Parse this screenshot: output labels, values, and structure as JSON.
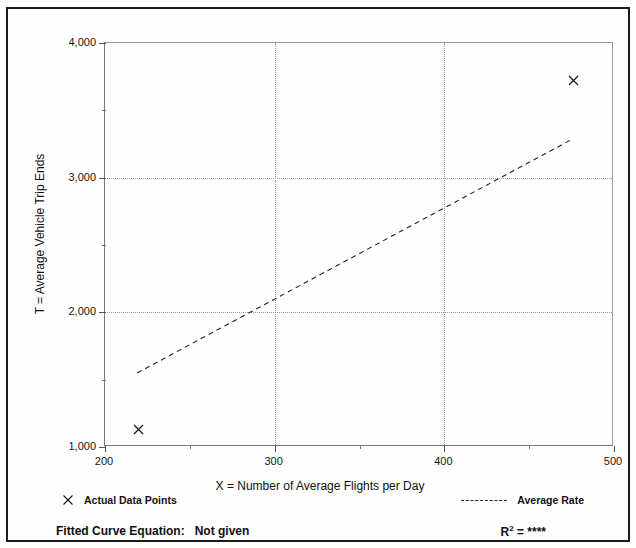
{
  "document": {
    "top_crop_left": "",
    "top_crop_right": ""
  },
  "chart_data": {
    "type": "scatter",
    "title": "",
    "xlabel": "X = Number of Average Flights per Day",
    "ylabel": "T = Average Vehicle Trip Ends",
    "xlim": [
      200,
      500
    ],
    "ylim": [
      1000,
      4000
    ],
    "x_ticks": [
      200,
      300,
      400,
      500
    ],
    "x_tick_labels": [
      "200",
      "300",
      "400",
      "500"
    ],
    "x_minor_ticks": [
      250,
      350,
      450
    ],
    "y_ticks": [
      1000,
      2000,
      3000,
      4000
    ],
    "y_tick_labels": [
      "1,000",
      "2,000",
      "3,000",
      "4,000"
    ],
    "y_minor_ticks": [
      1500,
      2500,
      3500
    ],
    "grid": "dotted-major",
    "legend_position": "below-plot",
    "series": [
      {
        "name": "Actual Data Points",
        "type": "scatter",
        "marker": "x",
        "points": [
          {
            "x": 220,
            "y": 1130
          },
          {
            "x": 476,
            "y": 3720
          }
        ]
      },
      {
        "name": "Average Rate",
        "type": "line",
        "style": "dashed",
        "points": [
          {
            "x": 219,
            "y": 1550
          },
          {
            "x": 476,
            "y": 3290
          }
        ]
      }
    ]
  },
  "legend": {
    "actual_points_label": "Actual Data Points",
    "average_rate_label": "Average Rate"
  },
  "footer": {
    "fitted_curve_label": "Fitted Curve Equation:",
    "fitted_curve_value": "Not given",
    "r2_label": "R",
    "r2_exponent": "2",
    "r2_equals": "=",
    "r2_value": "****"
  }
}
